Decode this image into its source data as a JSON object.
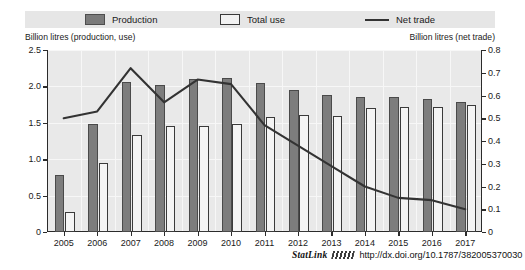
{
  "legend": {
    "production_label": "Production",
    "total_use_label": "Total use",
    "net_trade_label": "Net trade",
    "production_color": "#7d7d7d",
    "total_use_color": "#f4f4f4",
    "net_trade_color": "#333333"
  },
  "axis_captions": {
    "left": "Billion litres (production, use)",
    "right": "Billion litres (net trade)"
  },
  "footer": {
    "statlink_label": "StatLink",
    "doi_url": "http://dx.doi.org/10.1787/382005370030"
  },
  "chart_data": {
    "type": "bar",
    "title": "",
    "xlabel": "",
    "ylabel": "Billion litres (production, use)",
    "y2label": "Billion litres (net trade)",
    "grid": true,
    "legend_position": "top",
    "categories": [
      "2005",
      "2006",
      "2007",
      "2008",
      "2009",
      "2010",
      "2011",
      "2012",
      "2013",
      "2014",
      "2015",
      "2016",
      "2017"
    ],
    "ylim": [
      0,
      2.5
    ],
    "yticks": [
      "0",
      "0.5",
      "1.0",
      "1.5",
      "2.0",
      "2.5"
    ],
    "ytick_values": [
      0,
      0.5,
      1.0,
      1.5,
      2.0,
      2.5
    ],
    "y2lim": [
      0,
      0.8
    ],
    "y2ticks": [
      "0",
      "0.1",
      "0.2",
      "0.3",
      "0.4",
      "0.5",
      "0.6",
      "0.7",
      "0.8"
    ],
    "y2tick_values": [
      0,
      0.1,
      0.2,
      0.3,
      0.4,
      0.5,
      0.6,
      0.7,
      0.8
    ],
    "series": [
      {
        "name": "Production",
        "type": "bar",
        "axis": "left",
        "values": [
          0.78,
          1.49,
          2.06,
          2.02,
          2.1,
          2.12,
          2.05,
          1.95,
          1.88,
          1.86,
          1.85,
          1.83,
          1.78
        ]
      },
      {
        "name": "Total use",
        "type": "bar",
        "axis": "left",
        "values": [
          0.28,
          0.95,
          1.33,
          1.45,
          1.45,
          1.48,
          1.58,
          1.61,
          1.6,
          1.7,
          1.72,
          1.72,
          1.75
        ]
      },
      {
        "name": "Net trade",
        "type": "line",
        "axis": "right",
        "values": [
          0.5,
          0.53,
          0.72,
          0.57,
          0.67,
          0.65,
          0.47,
          0.38,
          0.29,
          0.2,
          0.15,
          0.14,
          0.1
        ]
      }
    ]
  }
}
